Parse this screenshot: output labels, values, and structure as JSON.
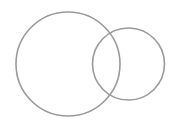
{
  "diagram": {
    "type": "venn",
    "background": "#ffffff",
    "stroke_color": "#9a9a9a",
    "stroke_width": 1.6,
    "circles": [
      {
        "name": "large-circle",
        "cx": 68,
        "cy": 64,
        "r": 52
      },
      {
        "name": "small-circle",
        "cx": 128.5,
        "cy": 64,
        "r": 36
      }
    ]
  }
}
